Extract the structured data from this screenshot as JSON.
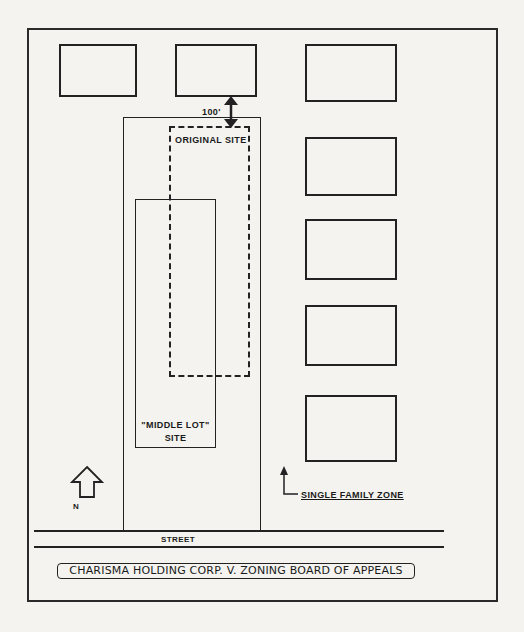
{
  "diagram": {
    "labels": {
      "original_site": "ORIGINAL SITE",
      "middle_lot_line1": "\"MIDDLE LOT\"",
      "middle_lot_line2": "SITE",
      "distance": "100'",
      "single_family_zone": "SINGLE FAMILY ZONE",
      "street": "STREET",
      "north": "N",
      "caption": "CHARISMA HOLDING CORP.  V. ZONING BOARD OF APPEALS"
    },
    "icons": {
      "north_arrow": "north-arrow-icon",
      "distance_arrow": "double-headed-arrow-icon",
      "zone_pointer": "up-arrow-icon"
    },
    "buildings": [
      {
        "id": "top-left"
      },
      {
        "id": "top-middle"
      },
      {
        "id": "right-1"
      },
      {
        "id": "right-2"
      },
      {
        "id": "right-3"
      },
      {
        "id": "right-4"
      },
      {
        "id": "right-5"
      }
    ],
    "colors": {
      "line": "#222222",
      "background": "#f4f3f0"
    }
  }
}
